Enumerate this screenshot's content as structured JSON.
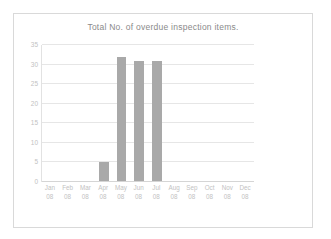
{
  "chart_data": {
    "type": "bar",
    "title": "Total No. of overdue inspection items.",
    "xlabel": "",
    "ylabel": "",
    "categories": [
      "Jan 08",
      "Feb 08",
      "Mar 08",
      "Apr 08",
      "May 08",
      "Jun 08",
      "Jul 08",
      "Aug 08",
      "Sep 08",
      "Oct 08",
      "Nov 08",
      "Dec 08"
    ],
    "category_month": [
      "Jan",
      "Feb",
      "Mar",
      "Apr",
      "May",
      "Jun",
      "Jul",
      "Aug",
      "Sep",
      "Oct",
      "Nov",
      "Dec"
    ],
    "category_year": [
      "08",
      "08",
      "08",
      "08",
      "08",
      "08",
      "08",
      "08",
      "08",
      "08",
      "08",
      "08"
    ],
    "values": [
      0,
      0,
      0,
      5,
      32,
      31,
      31,
      0,
      0,
      0,
      0,
      0
    ],
    "ylim": [
      0,
      35
    ],
    "yticks": [
      0,
      5,
      10,
      15,
      20,
      25,
      30,
      35
    ],
    "ytick_labels": [
      "0",
      "5",
      "10",
      "15",
      "20",
      "25",
      "30",
      "35"
    ],
    "grid": true,
    "legend": false,
    "bar_color": "#a9a9a9",
    "gridline_color": "#e6e6e6",
    "border_color": "#d9d9d9",
    "title_color": "#8a8a8a",
    "tick_label_color": "#c2c2c2"
  }
}
